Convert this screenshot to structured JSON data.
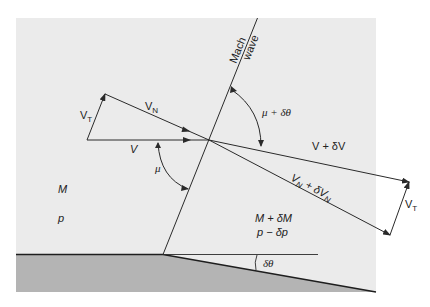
{
  "diagram": {
    "colors": {
      "panel": "#ebebeb",
      "ground": "#b4b4b4",
      "line": "#2a2a2a",
      "background": "#ffffff"
    },
    "labels": {
      "mach_wave_line1": "Mach",
      "mach_wave_line2": "wave",
      "v_t_upstream": "V",
      "v_t_upstream_sub": "T",
      "v_n": "V",
      "v_n_sub": "N",
      "v": "V",
      "mu": "μ",
      "mu_plus_dtheta": "μ + δθ",
      "v_plus_dv": "V + δV",
      "vn_plus_dvn_a": "V",
      "vn_plus_dvn_a_sub": "N",
      "vn_plus_dvn_b": " + δV",
      "vn_plus_dvn_b_sub": "N",
      "v_t_downstream": "V",
      "v_t_downstream_sub": "T",
      "upstream_mach": "M",
      "upstream_pressure": "p",
      "downstream_mach": "M + δM",
      "downstream_pressure": "p − δp",
      "deflection_angle": "δθ"
    }
  }
}
